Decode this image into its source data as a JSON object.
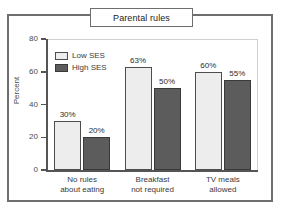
{
  "figure": {
    "title": "Parental rules"
  },
  "chart_data": {
    "type": "bar",
    "title": "Parental rules",
    "xlabel": "",
    "ylabel": "Percent",
    "ylim": [
      0,
      80
    ],
    "yticks": [
      0,
      20,
      40,
      60,
      80
    ],
    "ytick_labels": [
      "0",
      "20",
      "40",
      "60",
      "80"
    ],
    "grid": false,
    "legend_position": "upper-left-inside",
    "categories": [
      "No rules about eating",
      "Breakfast not required",
      "TV meals allowed"
    ],
    "category_lines": [
      [
        "No rules",
        "about eating"
      ],
      [
        "Breakfast",
        "not required"
      ],
      [
        "TV meals",
        "allowed"
      ]
    ],
    "series": [
      {
        "name": "Low SES",
        "color": "#ededed",
        "values": [
          30,
          63,
          60
        ],
        "data_labels": [
          "30%",
          "63%",
          "60%"
        ]
      },
      {
        "name": "High SES",
        "color": "#5c5c5c",
        "values": [
          20,
          50,
          55
        ],
        "data_labels": [
          "20%",
          "50%",
          "55%"
        ]
      }
    ]
  },
  "colors": {
    "low_ses": "#ededed",
    "high_ses": "#5c5c5c",
    "frame": "#6e6e6e",
    "axis": "#555555",
    "text": "#3a3a3a"
  }
}
